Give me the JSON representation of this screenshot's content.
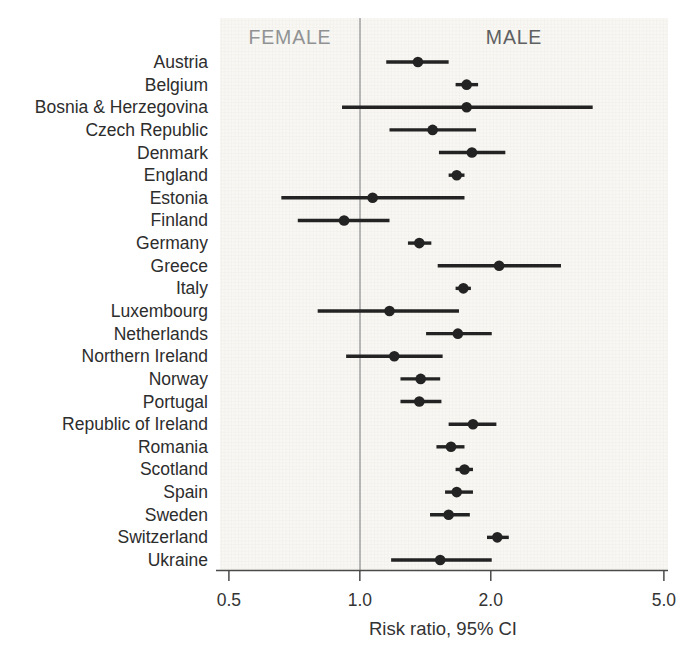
{
  "chart_data": {
    "type": "scatter",
    "variant": "forest-plot",
    "title": "",
    "xlabel": "Risk ratio, 95% CI",
    "x_scale": "log",
    "x_tick_labels": [
      "0.5",
      "1.0",
      "2.0",
      "5.0"
    ],
    "x_tick_values": [
      0.5,
      1.0,
      2.0,
      5.0
    ],
    "xlim": [
      0.477,
      5.11
    ],
    "reference_line": 1.0,
    "grid": "fine graph-paper texture inside plot area",
    "legend_position": "none",
    "header_labels": {
      "left": "FEMALE",
      "right": "MALE"
    },
    "rows": [
      {
        "country": "Austria",
        "rr": 1.36,
        "ci_low": 1.15,
        "ci_high": 1.6
      },
      {
        "country": "Belgium",
        "rr": 1.76,
        "ci_low": 1.66,
        "ci_high": 1.87
      },
      {
        "country": "Bosnia & Herzegovina",
        "rr": 1.76,
        "ci_low": 0.91,
        "ci_high": 3.43
      },
      {
        "country": "Czech Republic",
        "rr": 1.47,
        "ci_low": 1.17,
        "ci_high": 1.85
      },
      {
        "country": "Denmark",
        "rr": 1.81,
        "ci_low": 1.52,
        "ci_high": 2.16
      },
      {
        "country": "England",
        "rr": 1.67,
        "ci_low": 1.6,
        "ci_high": 1.74
      },
      {
        "country": "Estonia",
        "rr": 1.07,
        "ci_low": 0.66,
        "ci_high": 1.74
      },
      {
        "country": "Finland",
        "rr": 0.92,
        "ci_low": 0.72,
        "ci_high": 1.17
      },
      {
        "country": "Germany",
        "rr": 1.37,
        "ci_low": 1.29,
        "ci_high": 1.46
      },
      {
        "country": "Greece",
        "rr": 2.09,
        "ci_low": 1.51,
        "ci_high": 2.9
      },
      {
        "country": "Italy",
        "rr": 1.73,
        "ci_low": 1.66,
        "ci_high": 1.8
      },
      {
        "country": "Luxembourg",
        "rr": 1.17,
        "ci_low": 0.8,
        "ci_high": 1.69
      },
      {
        "country": "Netherlands",
        "rr": 1.68,
        "ci_low": 1.42,
        "ci_high": 2.01
      },
      {
        "country": "Northern Ireland",
        "rr": 1.2,
        "ci_low": 0.93,
        "ci_high": 1.55
      },
      {
        "country": "Norway",
        "rr": 1.38,
        "ci_low": 1.24,
        "ci_high": 1.53
      },
      {
        "country": "Portugal",
        "rr": 1.37,
        "ci_low": 1.24,
        "ci_high": 1.54
      },
      {
        "country": "Republic of Ireland",
        "rr": 1.82,
        "ci_low": 1.6,
        "ci_high": 2.06
      },
      {
        "country": "Romania",
        "rr": 1.62,
        "ci_low": 1.5,
        "ci_high": 1.74
      },
      {
        "country": "Scotland",
        "rr": 1.74,
        "ci_low": 1.66,
        "ci_high": 1.82
      },
      {
        "country": "Spain",
        "rr": 1.67,
        "ci_low": 1.57,
        "ci_high": 1.82
      },
      {
        "country": "Sweden",
        "rr": 1.6,
        "ci_low": 1.45,
        "ci_high": 1.79
      },
      {
        "country": "Switzerland",
        "rr": 2.07,
        "ci_low": 1.96,
        "ci_high": 2.2
      },
      {
        "country": "Ukraine",
        "rr": 1.53,
        "ci_low": 1.18,
        "ci_high": 2.01
      }
    ]
  },
  "colors": {
    "marker": "#232323",
    "ci_line": "#232323",
    "reference_line": "#8a8c8e",
    "axis": "#4a4a4a",
    "female_label": "#909294",
    "male_label": "#5e6062",
    "country_label": "#2d2d2d",
    "tick_label": "#333333",
    "axis_title": "#333333",
    "plot_bg": "#f8f7f3",
    "plot_grid": "#eceae4",
    "page_bg": "#ffffff"
  }
}
